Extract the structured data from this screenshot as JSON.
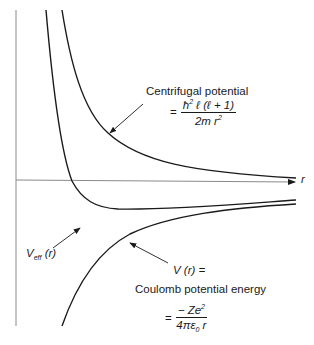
{
  "diagram": {
    "axes": {
      "x_label": "r",
      "y_axis": true
    },
    "curves": [
      {
        "name": "centrifugal",
        "label": "Centrifugal potential"
      },
      {
        "name": "effective",
        "label": "V_eff(r)"
      },
      {
        "name": "coulomb",
        "label": "V(r) = Coulomb potential energy"
      }
    ],
    "centrifugal": {
      "label": "Centrifugal potential",
      "eq": "=",
      "numerator_hbar": "ħ",
      "numerator_sup": "2",
      "numerator_rest": " ℓ (ℓ + 1)",
      "denominator_main": "2m r",
      "denominator_sup": "2"
    },
    "effective": {
      "label_main": "V",
      "label_sub": "eff",
      "label_arg": " (r)"
    },
    "coulomb": {
      "label_vr": "V (r) =",
      "label": "Coulomb potential energy",
      "eq": "=",
      "numerator_main": "− Ze",
      "numerator_sup": "2",
      "denominator_main": "4πε",
      "denominator_sub": "0",
      "denominator_end": " r"
    },
    "colors": {
      "curve": "#1a1a1a",
      "axis": "#777777"
    }
  }
}
